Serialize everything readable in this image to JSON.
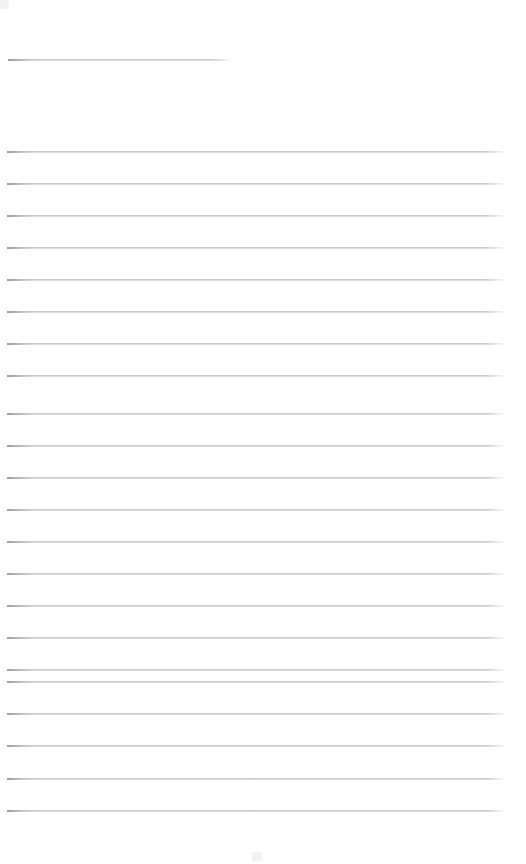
{
  "document": {
    "type": "scanned-ruled-notebook-page",
    "title": "",
    "page_width": 526,
    "page_height": 864,
    "background_color": "#ffffff",
    "rule_color": "#a8acae",
    "rule_thickness": 2,
    "rule_spacing": 32,
    "content_text": "",
    "is_blank": true,
    "handwriting_present": false
  },
  "rules": [
    {
      "id": "rule-header",
      "y": 59,
      "x_start": 8,
      "x_end": 230,
      "full_width": false
    },
    {
      "id": "rule-1",
      "y": 151,
      "x_start": 7,
      "x_end": 504,
      "full_width": true
    },
    {
      "id": "rule-2",
      "y": 183,
      "x_start": 7,
      "x_end": 504,
      "full_width": true
    },
    {
      "id": "rule-3",
      "y": 215,
      "x_start": 7,
      "x_end": 504,
      "full_width": true
    },
    {
      "id": "rule-4",
      "y": 247,
      "x_start": 7,
      "x_end": 504,
      "full_width": true
    },
    {
      "id": "rule-5",
      "y": 279,
      "x_start": 7,
      "x_end": 504,
      "full_width": true
    },
    {
      "id": "rule-6",
      "y": 311,
      "x_start": 7,
      "x_end": 504,
      "full_width": true
    },
    {
      "id": "rule-7",
      "y": 343,
      "x_start": 7,
      "x_end": 504,
      "full_width": true
    },
    {
      "id": "rule-8",
      "y": 375,
      "x_start": 7,
      "x_end": 504,
      "full_width": true
    },
    {
      "id": "rule-9",
      "y": 413,
      "x_start": 7,
      "x_end": 504,
      "full_width": true
    },
    {
      "id": "rule-10",
      "y": 445,
      "x_start": 7,
      "x_end": 504,
      "full_width": true
    },
    {
      "id": "rule-11",
      "y": 477,
      "x_start": 7,
      "x_end": 504,
      "full_width": true
    },
    {
      "id": "rule-12",
      "y": 509,
      "x_start": 7,
      "x_end": 504,
      "full_width": true
    },
    {
      "id": "rule-13",
      "y": 541,
      "x_start": 7,
      "x_end": 504,
      "full_width": true
    },
    {
      "id": "rule-14",
      "y": 573,
      "x_start": 7,
      "x_end": 504,
      "full_width": true
    },
    {
      "id": "rule-15",
      "y": 605,
      "x_start": 7,
      "x_end": 504,
      "full_width": true
    },
    {
      "id": "rule-16",
      "y": 637,
      "x_start": 7,
      "x_end": 504,
      "full_width": true
    },
    {
      "id": "rule-17",
      "y": 669,
      "x_start": 7,
      "x_end": 504,
      "full_width": true
    },
    {
      "id": "rule-18",
      "y": 681,
      "x_start": 7,
      "x_end": 504,
      "full_width": true
    },
    {
      "id": "rule-19",
      "y": 713,
      "x_start": 7,
      "x_end": 504,
      "full_width": true
    },
    {
      "id": "rule-20",
      "y": 745,
      "x_start": 7,
      "x_end": 504,
      "full_width": true
    },
    {
      "id": "rule-21",
      "y": 778,
      "x_start": 7,
      "x_end": 504,
      "full_width": true
    },
    {
      "id": "rule-22",
      "y": 810,
      "x_start": 7,
      "x_end": 504,
      "full_width": true
    }
  ],
  "artifacts": [
    {
      "id": "bottom-speck",
      "x": 252,
      "y": 852
    },
    {
      "id": "corner-smudge",
      "x": 0,
      "y": 0
    }
  ]
}
